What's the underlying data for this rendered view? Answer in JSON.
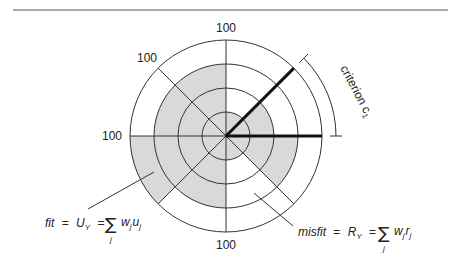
{
  "diagram": {
    "type": "polar-fit-diagram",
    "center": {
      "x": 226,
      "y": 136
    },
    "ring_radii": [
      24,
      48,
      72,
      96
    ],
    "axis_max_label": "100",
    "axis_labels": {
      "top": "100",
      "upper_left": "100",
      "left": "100",
      "bottom": "100"
    },
    "sectors": [
      {
        "from_deg": 0,
        "to_deg": 45,
        "shaded_ring": 2
      },
      {
        "from_deg": 45,
        "to_deg": 90,
        "shaded_ring": 1
      },
      {
        "from_deg": 90,
        "to_deg": 135,
        "shaded_ring": 3
      },
      {
        "from_deg": 135,
        "to_deg": 180,
        "shaded_ring": 3
      },
      {
        "from_deg": 180,
        "to_deg": 225,
        "shaded_ring": 4
      },
      {
        "from_deg": 225,
        "to_deg": 270,
        "shaded_ring": 3
      },
      {
        "from_deg": 270,
        "to_deg": 315,
        "shaded_ring": 1
      },
      {
        "from_deg": 315,
        "to_deg": 360,
        "shaded_ring": 3
      }
    ],
    "highlighted_axes_deg": [
      0,
      45
    ],
    "criterion_label": "criterion c",
    "criterion_subscript": "1",
    "fit_equation": {
      "lhs": "fit",
      "eq1": "=",
      "mid": "U",
      "mid_sub": "Y",
      "eq2": "=",
      "sigma": "∑",
      "sigma_sub": "j",
      "term_w": "w",
      "term_w_sub": "j",
      "term_x": "u",
      "term_x_sub": "j"
    },
    "misfit_equation": {
      "lhs": "misfit",
      "eq1": "=",
      "mid": "R",
      "mid_sub": "Y",
      "eq2": "=",
      "sigma": "∑",
      "sigma_sub": "j",
      "term_w": "w",
      "term_w_sub": "j",
      "term_x": "r",
      "term_x_sub": "j"
    },
    "colors": {
      "shade": "#d9d9d9",
      "line": "#333333",
      "thick_line": "#111111",
      "rule": "#555555"
    }
  }
}
